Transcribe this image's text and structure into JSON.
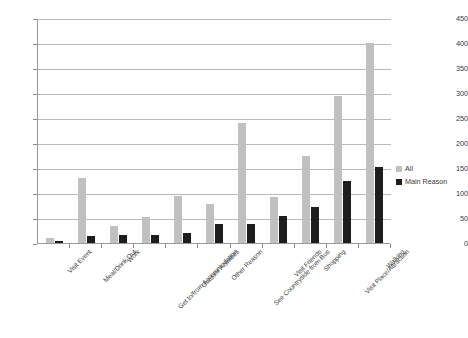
{
  "chart_data": {
    "type": "bar",
    "title": "",
    "xlabel": "",
    "ylabel": "",
    "ylim": [
      0,
      450
    ],
    "ytick_step": 50,
    "yticks": [
      0,
      50,
      100,
      150,
      200,
      250,
      300,
      350,
      400,
      450
    ],
    "grid": true,
    "legend_position": "right",
    "orientation": "vertical",
    "grouping": "grouped",
    "categories": [
      "Visit Event",
      "Meal/Drink Out",
      "Work",
      "Get to/from Accommodation",
      "Outdoor Activities",
      "Other Reason",
      "See Countryside from Bus",
      "Visit Friends",
      "Shopping",
      "Visit Place/Attraction",
      "Walking"
    ],
    "series": [
      {
        "name": "All",
        "color": "#c0c0c0",
        "values": [
          10,
          130,
          35,
          53,
          95,
          78,
          240,
          93,
          175,
          295,
          400
        ]
      },
      {
        "name": "Main Reason",
        "color": "#1d1d1d",
        "values": [
          5,
          15,
          17,
          17,
          20,
          38,
          38,
          55,
          72,
          125,
          152
        ]
      }
    ]
  },
  "legend": {
    "items": [
      {
        "label": "All",
        "swatch": "all"
      },
      {
        "label": "Main Reason",
        "swatch": "main"
      }
    ]
  },
  "colors": {
    "series_all": "#c0c0c0",
    "series_main": "#1d1d1d",
    "gridline": "#b9b9b9",
    "axis": "#9a9a9a",
    "background": "#ffffff",
    "text": "#3a3a3a"
  }
}
